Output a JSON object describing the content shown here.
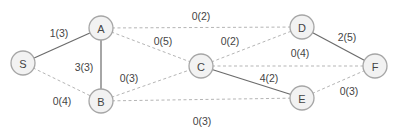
{
  "diagram": {
    "type": "network-flow-graph",
    "label_format": "flow(capacity)",
    "nodes": [
      {
        "id": "S",
        "label": "S",
        "x": 23,
        "y": 63
      },
      {
        "id": "A",
        "label": "A",
        "x": 101,
        "y": 28
      },
      {
        "id": "B",
        "label": "B",
        "x": 101,
        "y": 101
      },
      {
        "id": "C",
        "label": "C",
        "x": 201,
        "y": 66
      },
      {
        "id": "D",
        "label": "D",
        "x": 302,
        "y": 27
      },
      {
        "id": "E",
        "label": "E",
        "x": 302,
        "y": 98
      },
      {
        "id": "F",
        "label": "F",
        "x": 375,
        "y": 66
      }
    ],
    "edges": [
      {
        "from": "S",
        "to": "A",
        "label": "1(3)",
        "style": "solid",
        "lx": 59,
        "ly": 33
      },
      {
        "from": "S",
        "to": "B",
        "label": "0(4)",
        "style": "dashed",
        "lx": 62,
        "ly": 101
      },
      {
        "from": "A",
        "to": "B",
        "label": "3(3)",
        "style": "solid",
        "lx": 84,
        "ly": 67
      },
      {
        "from": "A",
        "to": "D",
        "label": "0(2)",
        "style": "dashed",
        "lx": 201,
        "ly": 16
      },
      {
        "from": "A",
        "to": "C",
        "label": "0(5)",
        "style": "dashed",
        "lx": 163,
        "ly": 41
      },
      {
        "from": "B",
        "to": "C",
        "label": "0(3)",
        "style": "dashed",
        "lx": 129,
        "ly": 78
      },
      {
        "from": "B",
        "to": "E",
        "label": "0(3)",
        "style": "dashed",
        "lx": 202,
        "ly": 121
      },
      {
        "from": "C",
        "to": "D",
        "label": "0(2)",
        "style": "dashed",
        "lx": 230,
        "ly": 41
      },
      {
        "from": "C",
        "to": "F",
        "label": "0(4)",
        "style": "dashed",
        "lx": 300,
        "ly": 53
      },
      {
        "from": "C",
        "to": "E",
        "label": "4(2)",
        "style": "solid",
        "lx": 269,
        "ly": 78
      },
      {
        "from": "D",
        "to": "F",
        "label": "2(5)",
        "style": "solid",
        "lx": 347,
        "ly": 37
      },
      {
        "from": "E",
        "to": "F",
        "label": "0(3)",
        "style": "dashed",
        "lx": 349,
        "ly": 91
      }
    ],
    "node_radius": 12,
    "colors": {
      "node_fill": "#f2f2f2",
      "node_stroke": "#a6a6a6",
      "solid_edge": "#6b6b6b",
      "dashed_edge": "#b5b5b5",
      "text": "#444444"
    }
  }
}
